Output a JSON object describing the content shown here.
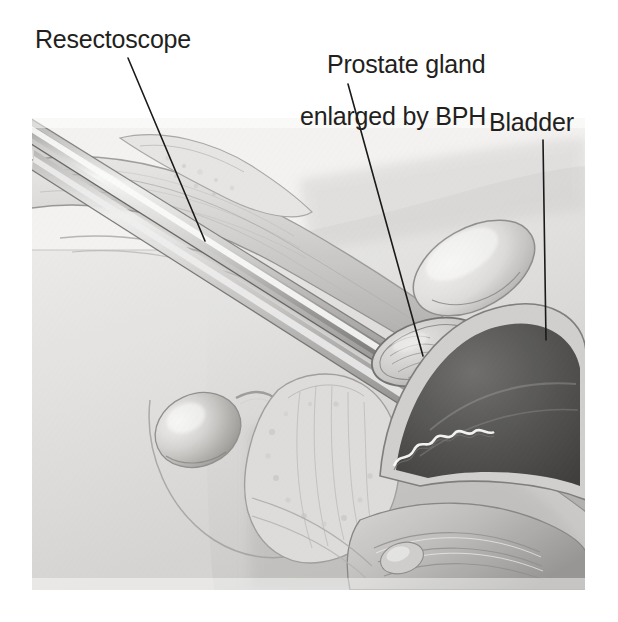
{
  "figure": {
    "kind": "medical-illustration",
    "style": "grayscale graphite anatomical drawing",
    "background_color": "#ffffff",
    "ink_color": "#231f20",
    "leader_line_color": "#1a1a1a",
    "leader_line_width": 1.6,
    "bounds": {
      "x": 32,
      "y": 118,
      "width": 553,
      "height": 472
    }
  },
  "labels": {
    "resectoscope": {
      "text": "Resectoscope",
      "x": 35,
      "y": 27,
      "leader": {
        "x1": 128,
        "y1": 58,
        "x2": 205,
        "y2": 241
      }
    },
    "prostate": {
      "line1": "Prostate gland",
      "line2": "enlarged by BPH",
      "x": 300,
      "y": 27,
      "leader": {
        "x1": 348,
        "y1": 84,
        "x2": 423,
        "y2": 356
      }
    },
    "bladder": {
      "text": "Bladder",
      "x": 489,
      "y": 110,
      "leader": {
        "x1": 543,
        "y1": 140,
        "x2": 546,
        "y2": 340
      }
    }
  },
  "anatomy": {
    "structures": [
      "abdominal wall",
      "penis shaft",
      "urethra",
      "testis",
      "scrotum",
      "prostate gland enlarged by BPH",
      "bladder lumen",
      "bladder wall",
      "pubic bone",
      "rectum",
      "seminal vesicle"
    ],
    "instrument": "resectoscope inserted through urethra into bladder neck"
  },
  "palette": {
    "paper": "#ffffff",
    "tissue_light": "#e4e3e1",
    "tissue_mid": "#c3c2c0",
    "tissue_dark": "#8e8d8b",
    "shadow": "#5f5e5d",
    "bladder_lumen": "#4a4a49",
    "metal_highlight": "#f4f4f3",
    "metal_mid": "#b9b9b7",
    "metal_shadow": "#6e6e6c",
    "outline": "#3a3a39"
  }
}
